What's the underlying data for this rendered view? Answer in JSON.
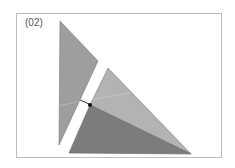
{
  "figure": {
    "label": "(02)",
    "colors": {
      "left_triangle": "#9e9e9e",
      "right_upper": "#b0b0b0",
      "right_lower": "#7a7a7a",
      "frame": "#bdbdbd"
    }
  }
}
